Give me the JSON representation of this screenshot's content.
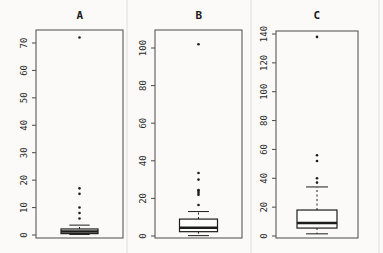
{
  "figure": {
    "background": "#fbfaf8",
    "frame_color": "#4a4a4a",
    "mark_color": "#1d1d1d"
  },
  "chart_data": {
    "type": "boxplot",
    "title": "",
    "xlabel": "",
    "ylabel": "",
    "legend": "none",
    "grid": false,
    "panels": [
      {
        "title": "A",
        "ylim": [
          0,
          76
        ],
        "yticks": [
          0,
          10,
          20,
          30,
          40,
          50,
          60,
          70
        ],
        "box": {
          "whisker_low": 0.2,
          "q1": 0.5,
          "median": 1.3,
          "q3": 2.2,
          "whisker_high": 3.6
        },
        "outliers": [
          6,
          8,
          10,
          15,
          17,
          72
        ]
      },
      {
        "title": "B",
        "ylim": [
          0,
          110
        ],
        "yticks": [
          0,
          20,
          40,
          60,
          80,
          100
        ],
        "box": {
          "whisker_low": 0.2,
          "q1": 2.3,
          "median": 4.4,
          "q3": 9,
          "whisker_high": 13
        },
        "outliers": [
          16.5,
          22,
          23,
          24,
          24.5,
          30,
          33.5,
          102
        ]
      },
      {
        "title": "C",
        "ylim": [
          0,
          141
        ],
        "yticks": [
          0,
          20,
          40,
          60,
          80,
          100,
          120,
          140
        ],
        "box": {
          "whisker_low": 1.5,
          "q1": 5.5,
          "median": 9,
          "q3": 18,
          "whisker_high": 34
        },
        "outliers": [
          37,
          40,
          52,
          56,
          138
        ]
      }
    ]
  }
}
